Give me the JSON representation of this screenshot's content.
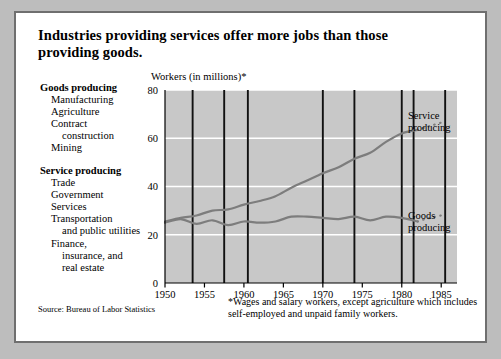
{
  "title": "Industries providing services offer more jobs than those providing goods.",
  "axis_title": "Workers (in millions)*",
  "legend": {
    "goods": {
      "heading": "Goods producing",
      "items": [
        "Manufacturing",
        "Agriculture",
        "Contract",
        "construction",
        "Mining"
      ]
    },
    "service": {
      "heading": "Service producing",
      "items": [
        "Trade",
        "Government",
        "Services",
        "Transportation",
        "and public utilities",
        "Finance,",
        "insurance, and",
        "real estate"
      ]
    }
  },
  "series_labels": {
    "service_line1": "Service",
    "service_line2": "producing",
    "goods_line1": "Goods",
    "goods_line2": "producing"
  },
  "source": "Source: Bureau of Labor Statistics",
  "footnote": "*Wages and salary workers, except agriculture which includes self-employed and unpaid family workers.",
  "colors": {
    "plot_background": "#c8c8c8",
    "gridline": "#ffffff",
    "recession_bar": "#111111",
    "line": "#7d7d7d",
    "card_border": "#6f6f6f",
    "page_background": "#bdbdbd"
  },
  "chart_data": {
    "type": "line",
    "title": "Industries providing services offer more jobs than those providing goods.",
    "xlabel": "",
    "ylabel": "Workers (in millions)*",
    "xlim": [
      1950,
      1987
    ],
    "ylim": [
      0,
      80
    ],
    "yticks": [
      0,
      20,
      40,
      60,
      80
    ],
    "xticks": [
      1950,
      1955,
      1960,
      1965,
      1970,
      1975,
      1980,
      1985
    ],
    "grid": true,
    "legend_position": "inline-right",
    "recession_bars": [
      1953.5,
      1957.5,
      1960.5,
      1970,
      1974,
      1980,
      1981.5,
      1985.5
    ],
    "series": [
      {
        "name": "Service producing",
        "color": "#7d7d7d",
        "x": [
          1950,
          1952,
          1954,
          1956,
          1958,
          1960,
          1962,
          1964,
          1966,
          1968,
          1970,
          1972,
          1974,
          1976,
          1978,
          1980,
          1982
        ],
        "values": [
          25.5,
          27.0,
          28.0,
          30.0,
          30.5,
          32.5,
          34.0,
          36.0,
          39.5,
          42.5,
          45.5,
          48.0,
          51.5,
          54.0,
          58.5,
          62.0,
          63.5
        ],
        "projection_x": [
          1983,
          1984,
          1985
        ],
        "projection_values": [
          64.5,
          65.5,
          66.5
        ],
        "projected_style": "dotted"
      },
      {
        "name": "Goods producing",
        "color": "#7d7d7d",
        "x": [
          1950,
          1952,
          1954,
          1956,
          1958,
          1960,
          1962,
          1964,
          1966,
          1968,
          1970,
          1972,
          1974,
          1976,
          1978,
          1980,
          1982
        ],
        "values": [
          25.0,
          26.5,
          24.5,
          26.0,
          24.0,
          25.5,
          25.0,
          25.5,
          27.5,
          27.5,
          27.0,
          26.5,
          27.5,
          26.0,
          27.5,
          27.0,
          25.5
        ],
        "projection_x": [
          1983,
          1984,
          1985
        ],
        "projection_values": [
          26.5,
          27.3,
          28.0
        ],
        "projected_style": "dotted"
      }
    ]
  }
}
